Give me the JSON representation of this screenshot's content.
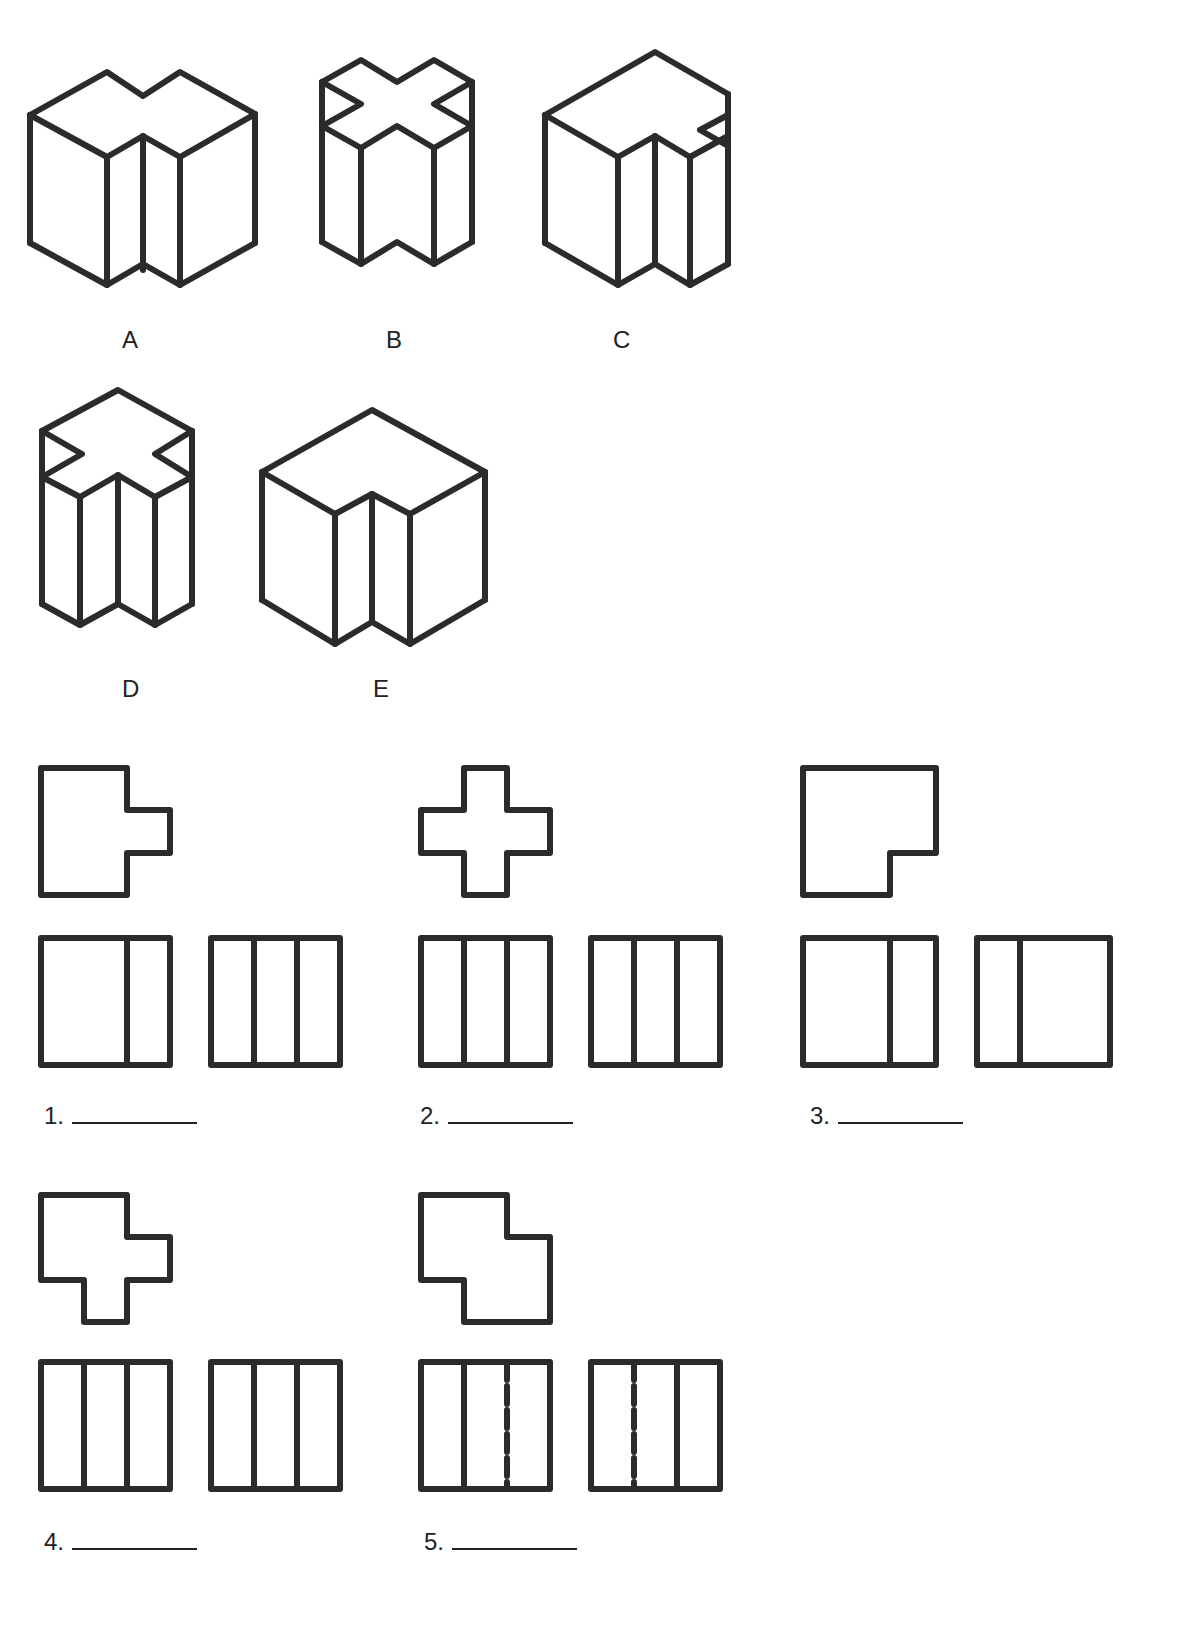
{
  "instructions_fragment": "Study the isometric drawings and match each to its orthographic projection.",
  "isometric_labels": [
    "A",
    "B",
    "C",
    "D",
    "E"
  ],
  "orthographic_items": [
    {
      "number": "1.",
      "answer": ""
    },
    {
      "number": "2.",
      "answer": ""
    },
    {
      "number": "3.",
      "answer": ""
    },
    {
      "number": "4.",
      "answer": ""
    },
    {
      "number": "5.",
      "answer": ""
    }
  ],
  "colors": {
    "line": "#2b2b2b",
    "background": "#ffffff"
  }
}
